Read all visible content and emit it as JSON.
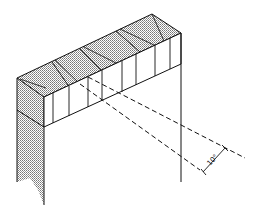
{
  "diagram": {
    "annotation": {
      "angle_label": "10°"
    },
    "colors": {
      "stroke": "#111111",
      "shade": "#bdbdbd",
      "background": "#ffffff"
    }
  }
}
